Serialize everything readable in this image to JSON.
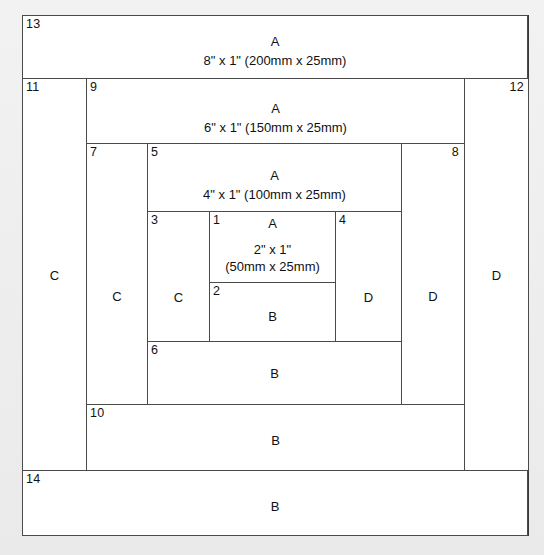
{
  "diagram": {
    "fabric_labels": {
      "a": "A",
      "b": "B",
      "c": "C",
      "d": "D"
    },
    "colors": {
      "line": "#4a4a4a",
      "outer_line": "#3a3a3a",
      "page_bg": "#efefef",
      "block_bg": "#ffffff"
    },
    "pieces": [
      {
        "number": "1",
        "fabric": "A",
        "dim_imperial": "2\" x 1\"",
        "dim_metric": "(50mm x 25mm)"
      },
      {
        "number": "2",
        "fabric": "B",
        "dim_imperial": "",
        "dim_metric": ""
      },
      {
        "number": "3",
        "fabric": "C",
        "dim_imperial": "",
        "dim_metric": ""
      },
      {
        "number": "4",
        "fabric": "D",
        "dim_imperial": "",
        "dim_metric": ""
      },
      {
        "number": "5",
        "fabric": "A",
        "dim_imperial": "4\" x 1\" (100mm x 25mm)",
        "dim_metric": ""
      },
      {
        "number": "6",
        "fabric": "B",
        "dim_imperial": "",
        "dim_metric": ""
      },
      {
        "number": "7",
        "fabric": "C",
        "dim_imperial": "",
        "dim_metric": ""
      },
      {
        "number": "8",
        "fabric": "D",
        "dim_imperial": "",
        "dim_metric": ""
      },
      {
        "number": "9",
        "fabric": "A",
        "dim_imperial": "6\" x 1\" (150mm x 25mm)",
        "dim_metric": ""
      },
      {
        "number": "10",
        "fabric": "B",
        "dim_imperial": "",
        "dim_metric": ""
      },
      {
        "number": "11",
        "fabric": "C",
        "dim_imperial": "",
        "dim_metric": ""
      },
      {
        "number": "12",
        "fabric": "D",
        "dim_imperial": "",
        "dim_metric": ""
      },
      {
        "number": "13",
        "fabric": "A",
        "dim_imperial": "8\" x 1\" (200mm x 25mm)",
        "dim_metric": ""
      },
      {
        "number": "14",
        "fabric": "B",
        "dim_imperial": "",
        "dim_metric": ""
      }
    ]
  }
}
